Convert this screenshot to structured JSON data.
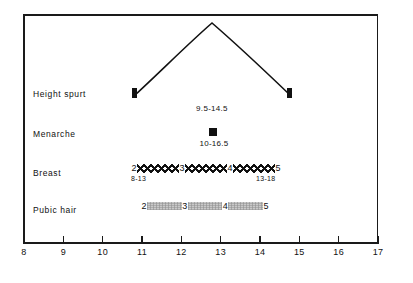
{
  "chart_data": {
    "type": "table",
    "title": "",
    "xlabel": "",
    "ylabel": "",
    "xlim": [
      8,
      17
    ],
    "grid": false,
    "legend": "none",
    "x_ticks": [
      {
        "value": 8,
        "label": "8"
      },
      {
        "value": 9,
        "label": "9"
      },
      {
        "value": 10,
        "label": "10"
      },
      {
        "value": 11,
        "label": "11"
      },
      {
        "value": 12,
        "label": "12"
      },
      {
        "value": 13,
        "label": "13"
      },
      {
        "value": 14,
        "label": "14"
      },
      {
        "value": 15,
        "label": "15"
      },
      {
        "value": 16,
        "label": "16"
      },
      {
        "value": 17,
        "label": "17"
      }
    ],
    "rows": [
      {
        "name": "height-spurt",
        "label": "Height spurt",
        "kind": "curve",
        "start": 10.9,
        "end": 14.5,
        "peak": 12.6,
        "range_label": "9.5-14.5",
        "range_label_x": 12.4
      },
      {
        "name": "menarche",
        "label": "Menarche",
        "kind": "point",
        "point": 13.0,
        "range_label": "10-16.5",
        "range_label_x": 13.0
      },
      {
        "name": "breast",
        "label": "Breast",
        "kind": "stages-cross",
        "start": 10.9,
        "end": 14.55,
        "stages": [
          "2",
          "3",
          "4",
          "5"
        ],
        "stage_positions": [
          10.9,
          12.05,
          13.0,
          14.55
        ],
        "left_range": "8-13",
        "right_range": "13-18"
      },
      {
        "name": "pubic-hair",
        "label": "Pubic hair",
        "kind": "stages-stipple",
        "start": 11.1,
        "end": 14.1,
        "stages": [
          "2",
          "3",
          "4",
          "5"
        ],
        "stage_positions": [
          11.1,
          12.1,
          12.95,
          14.1
        ],
        "left_range": "",
        "right_range": ""
      }
    ]
  },
  "colors": {
    "ink": "#111111",
    "frame": "#1a1a1a",
    "stipple": "#c9c9c9",
    "background": "#ffffff"
  }
}
